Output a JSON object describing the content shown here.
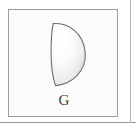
{
  "figure": {
    "panel": {
      "background_color": "#fbfbfb",
      "border_color": "#9e9e9e"
    },
    "shape": {
      "name": "half-ellipse",
      "description": "semicircular dome with flat left edge",
      "outline_color": "#6e6e6e",
      "fill_light": "#ffffff",
      "fill_mid": "#f2f2f2",
      "fill_shadow": "#c9c9c9"
    },
    "label": "G",
    "label_color": "#404040",
    "rules": {
      "bottom_color": "#9a9a9a",
      "right_color": "#b4b4b4"
    }
  }
}
